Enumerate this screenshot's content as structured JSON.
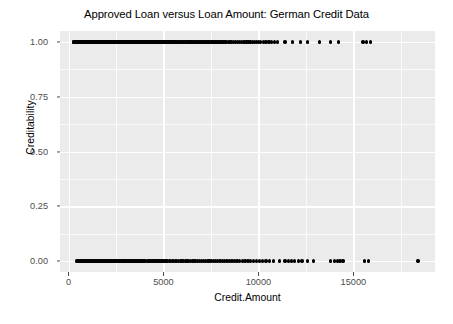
{
  "chart_data": {
    "type": "scatter",
    "title": "Approved Loan versus Loan Amount: German Credit Data",
    "xlabel": "Credit.Amount",
    "ylabel": "Creditability",
    "xlim": [
      -450,
      19300
    ],
    "ylim": [
      -0.05,
      1.05
    ],
    "grid": true,
    "legend": "none",
    "xticks": [
      0,
      5000,
      10000,
      15000
    ],
    "xtick_labels": [
      "0",
      "5000",
      "10000",
      "15000"
    ],
    "x_minor_ticks": [
      2500,
      7500,
      12500,
      17500
    ],
    "yticks": [
      0.0,
      0.25,
      0.5,
      0.75,
      1.0
    ],
    "ytick_labels": [
      "0.00",
      "0.25",
      "0.50",
      "0.75",
      "1.00"
    ],
    "y_minor_ticks": [
      0.125,
      0.375,
      0.625,
      0.875
    ],
    "point_color": "#000000",
    "panel_color": "#ebebeb",
    "gridline_color": "#ffffff",
    "series": [
      {
        "name": "Creditability = 1 (approved)",
        "y": 1.0,
        "x": [
          250,
          276,
          298,
          339,
          362,
          385,
          409,
          428,
          433,
          448,
          454,
          462,
          478,
          490,
          518,
          531,
          543,
          554,
          566,
          578,
          590,
          601,
          615,
          626,
          640,
          652,
          666,
          674,
          683,
          691,
          700,
          709,
          717,
          727,
          736,
          745,
          753,
          762,
          771,
          780,
          790,
          800,
          812,
          823,
          835,
          846,
          858,
          870,
          882,
          894,
          907,
          918,
          930,
          941,
          953,
          965,
          977,
          988,
          1000,
          1012,
          1024,
          1036,
          1047,
          1059,
          1071,
          1083,
          1095,
          1107,
          1118,
          1130,
          1142,
          1154,
          1166,
          1178,
          1190,
          1203,
          1215,
          1227,
          1239,
          1251,
          1262,
          1274,
          1286,
          1298,
          1311,
          1323,
          1335,
          1347,
          1359,
          1371,
          1383,
          1395,
          1407,
          1419,
          1431,
          1443,
          1455,
          1467,
          1479,
          1491,
          1503,
          1515,
          1527,
          1539,
          1551,
          1563,
          1575,
          1587,
          1599,
          1611,
          1623,
          1635,
          1647,
          1659,
          1671,
          1684,
          1696,
          1708,
          1720,
          1732,
          1744,
          1756,
          1768,
          1780,
          1792,
          1804,
          1816,
          1828,
          1840,
          1852,
          1864,
          1876,
          1888,
          1900,
          1912,
          1924,
          1936,
          1948,
          1960,
          1972,
          1984,
          1996,
          2008,
          2020,
          2032,
          2044,
          2056,
          2068,
          2080,
          2092,
          2104,
          2116,
          2128,
          2140,
          2152,
          2164,
          2176,
          2188,
          2200,
          2212,
          2224,
          2236,
          2248,
          2260,
          2272,
          2284,
          2296,
          2308,
          2320,
          2332,
          2344,
          2356,
          2368,
          2380,
          2392,
          2404,
          2416,
          2428,
          2440,
          2452,
          2464,
          2476,
          2488,
          2500,
          2515,
          2530,
          2545,
          2560,
          2575,
          2590,
          2605,
          2620,
          2635,
          2650,
          2665,
          2680,
          2695,
          2710,
          2725,
          2740,
          2755,
          2770,
          2785,
          2800,
          2815,
          2830,
          2845,
          2860,
          2875,
          2890,
          2905,
          2920,
          2935,
          2950,
          2965,
          2980,
          2995,
          3010,
          3025,
          3040,
          3055,
          3070,
          3085,
          3100,
          3115,
          3130,
          3145,
          3160,
          3175,
          3190,
          3205,
          3220,
          3235,
          3250,
          3265,
          3280,
          3295,
          3310,
          3325,
          3340,
          3355,
          3370,
          3385,
          3400,
          3420,
          3440,
          3460,
          3480,
          3500,
          3520,
          3540,
          3560,
          3580,
          3600,
          3620,
          3640,
          3660,
          3680,
          3700,
          3720,
          3740,
          3760,
          3780,
          3800,
          3820,
          3840,
          3860,
          3880,
          3900,
          3920,
          3940,
          3960,
          3980,
          4000,
          4025,
          4050,
          4075,
          4100,
          4125,
          4150,
          4175,
          4200,
          4225,
          4250,
          4275,
          4300,
          4325,
          4350,
          4375,
          4400,
          4425,
          4450,
          4475,
          4500,
          4530,
          4560,
          4590,
          4620,
          4650,
          4680,
          4710,
          4740,
          4770,
          4800,
          4830,
          4860,
          4890,
          4920,
          4950,
          4980,
          5010,
          5070,
          5100,
          5140,
          5180,
          5220,
          5260,
          5300,
          5340,
          5380,
          5420,
          5460,
          5500,
          5540,
          5580,
          5620,
          5660,
          5700,
          5750,
          5800,
          5850,
          5900,
          5950,
          6000,
          6050,
          6100,
          6150,
          6200,
          6250,
          6300,
          6350,
          6400,
          6450,
          6500,
          6560,
          6620,
          6680,
          6740,
          6800,
          6860,
          6920,
          6980,
          7040,
          7100,
          7160,
          7220,
          7280,
          7340,
          7400,
          7460,
          7520,
          7580,
          7640,
          7700,
          7760,
          7820,
          7880,
          7940,
          8000,
          8080,
          8160,
          8240,
          8330,
          8420,
          8510,
          8600,
          8700,
          8800,
          8900,
          9000,
          9100,
          9200,
          9300,
          9400,
          9500,
          9600,
          9700,
          9800,
          9900,
          10000,
          10100,
          10250,
          10400,
          10550,
          10700,
          10850,
          11000,
          11400,
          11800,
          12200,
          12600,
          13200,
          13800,
          14200,
          15500,
          15700,
          15900
        ]
      },
      {
        "name": "Creditability = 0 (denied)",
        "y": 0.0,
        "x": [
          420,
          460,
          520,
          580,
          640,
          700,
          760,
          820,
          880,
          940,
          1000,
          1060,
          1120,
          1180,
          1240,
          1300,
          1360,
          1420,
          1480,
          1540,
          1600,
          1660,
          1720,
          1780,
          1840,
          1900,
          1960,
          2020,
          2080,
          2140,
          2200,
          2260,
          2320,
          2380,
          2440,
          2500,
          2560,
          2620,
          2680,
          2740,
          2800,
          2860,
          2920,
          2980,
          3040,
          3100,
          3160,
          3220,
          3280,
          3340,
          3400,
          3460,
          3520,
          3580,
          3640,
          3700,
          3760,
          3820,
          3880,
          3940,
          4000,
          4070,
          4140,
          4210,
          4280,
          4350,
          4420,
          4490,
          4560,
          4630,
          4700,
          4770,
          4840,
          4910,
          4980,
          5060,
          5140,
          5220,
          5300,
          5380,
          5460,
          5540,
          5620,
          5700,
          5790,
          5880,
          5970,
          6060,
          6150,
          6240,
          6330,
          6420,
          6510,
          6600,
          6700,
          6800,
          6900,
          7000,
          7100,
          7200,
          7300,
          7400,
          7500,
          7620,
          7740,
          7860,
          7980,
          8100,
          8220,
          8350,
          8480,
          8610,
          8740,
          8870,
          9000,
          9150,
          9300,
          9450,
          9600,
          9750,
          9900,
          10050,
          10200,
          10400,
          10600,
          10800,
          11100,
          11400,
          11600,
          11750,
          11900,
          12100,
          12300,
          12600,
          12900,
          13800,
          14000,
          14150,
          14300,
          14450,
          15600,
          15800,
          18400
        ]
      }
    ]
  }
}
